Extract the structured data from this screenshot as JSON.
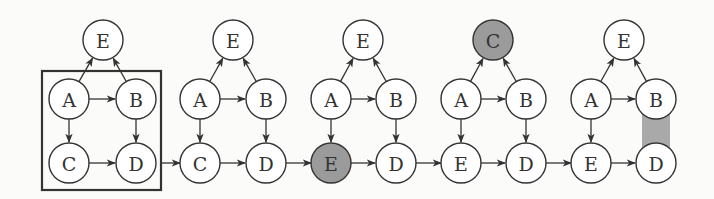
{
  "diagram": {
    "colors": {
      "node_fill": "#ffffff",
      "highlight_fill": "#9b9b9b",
      "stroke": "#333333",
      "highlight_rect": "#a9a9a9"
    },
    "frame": {
      "x": 42,
      "y": 71,
      "w": 119,
      "h": 119
    },
    "panels": [
      {
        "nodes": [
          {
            "id": "top",
            "label": "E",
            "x": 103,
            "y": 40,
            "highlight": false
          },
          {
            "id": "a",
            "label": "A",
            "x": 69,
            "y": 99,
            "highlight": false
          },
          {
            "id": "b",
            "label": "B",
            "x": 136,
            "y": 99,
            "highlight": false
          },
          {
            "id": "c",
            "label": "C",
            "x": 69,
            "y": 163,
            "highlight": false
          },
          {
            "id": "d",
            "label": "D",
            "x": 136,
            "y": 163,
            "highlight": false
          }
        ],
        "edges": [
          [
            "a",
            "top"
          ],
          [
            "b",
            "top"
          ],
          [
            "a",
            "b"
          ],
          [
            "a",
            "c"
          ],
          [
            "b",
            "d"
          ],
          [
            "c",
            "d"
          ]
        ]
      },
      {
        "nodes": [
          {
            "id": "top",
            "label": "E",
            "x": 233,
            "y": 40,
            "highlight": false
          },
          {
            "id": "a",
            "label": "A",
            "x": 200,
            "y": 99,
            "highlight": false
          },
          {
            "id": "b",
            "label": "B",
            "x": 266,
            "y": 99,
            "highlight": false
          },
          {
            "id": "c",
            "label": "C",
            "x": 200,
            "y": 163,
            "highlight": false
          },
          {
            "id": "d",
            "label": "D",
            "x": 266,
            "y": 163,
            "highlight": false
          }
        ],
        "edges": [
          [
            "a",
            "top"
          ],
          [
            "b",
            "top"
          ],
          [
            "a",
            "b"
          ],
          [
            "a",
            "c"
          ],
          [
            "b",
            "d"
          ],
          [
            "c",
            "d"
          ]
        ]
      },
      {
        "nodes": [
          {
            "id": "top",
            "label": "E",
            "x": 363,
            "y": 40,
            "highlight": false
          },
          {
            "id": "a",
            "label": "A",
            "x": 331,
            "y": 99,
            "highlight": false
          },
          {
            "id": "b",
            "label": "B",
            "x": 396,
            "y": 99,
            "highlight": false
          },
          {
            "id": "c",
            "label": "E",
            "x": 331,
            "y": 163,
            "highlight": true
          },
          {
            "id": "d",
            "label": "D",
            "x": 396,
            "y": 163,
            "highlight": false
          }
        ],
        "edges": [
          [
            "a",
            "top"
          ],
          [
            "b",
            "top"
          ],
          [
            "a",
            "b"
          ],
          [
            "a",
            "c"
          ],
          [
            "b",
            "d"
          ],
          [
            "c",
            "d"
          ]
        ]
      },
      {
        "nodes": [
          {
            "id": "top",
            "label": "C",
            "x": 493,
            "y": 40,
            "highlight": true
          },
          {
            "id": "a",
            "label": "A",
            "x": 461,
            "y": 99,
            "highlight": false
          },
          {
            "id": "b",
            "label": "B",
            "x": 526,
            "y": 99,
            "highlight": false
          },
          {
            "id": "c",
            "label": "E",
            "x": 461,
            "y": 163,
            "highlight": false
          },
          {
            "id": "d",
            "label": "D",
            "x": 526,
            "y": 163,
            "highlight": false
          }
        ],
        "edges": [
          [
            "a",
            "top"
          ],
          [
            "b",
            "top"
          ],
          [
            "a",
            "b"
          ],
          [
            "a",
            "c"
          ],
          [
            "b",
            "d"
          ],
          [
            "c",
            "d"
          ]
        ]
      },
      {
        "nodes": [
          {
            "id": "top",
            "label": "E",
            "x": 624,
            "y": 40,
            "highlight": false
          },
          {
            "id": "a",
            "label": "A",
            "x": 591,
            "y": 99,
            "highlight": false
          },
          {
            "id": "b",
            "label": "B",
            "x": 656,
            "y": 99,
            "highlight": false
          },
          {
            "id": "c",
            "label": "E",
            "x": 591,
            "y": 163,
            "highlight": false
          },
          {
            "id": "d",
            "label": "D",
            "x": 656,
            "y": 163,
            "highlight": false
          }
        ],
        "edges": [
          [
            "a",
            "top"
          ],
          [
            "b",
            "top"
          ],
          [
            "a",
            "b"
          ],
          [
            "a",
            "c"
          ],
          [
            "c",
            "d"
          ]
        ],
        "highlight_rect": {
          "x": 642,
          "y": 110,
          "w": 28,
          "h": 42
        }
      }
    ],
    "connectors": [
      {
        "from": [
          161,
          163
        ],
        "to": [
          180,
          163
        ]
      },
      {
        "from": [
          286,
          163
        ],
        "to": [
          311,
          163
        ]
      },
      {
        "from": [
          416,
          163
        ],
        "to": [
          441,
          163
        ]
      },
      {
        "from": [
          546,
          163
        ],
        "to": [
          571,
          163
        ]
      }
    ],
    "node_radius": 20
  }
}
